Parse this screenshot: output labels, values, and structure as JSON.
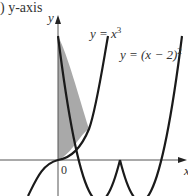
{
  "caption": "y-axis",
  "caption_prefix": ")",
  "axes": {
    "y_label": "y",
    "x_label": "x",
    "origin_label": "0"
  },
  "curves": [
    {
      "name": "cubic",
      "label_lhs": "y = x",
      "label_exp": "3",
      "equation": "y = x^3"
    },
    {
      "name": "parabola",
      "label_lhs": "y = (x − 2)",
      "label_exp": "2",
      "equation": "y = (x - 2)^2"
    }
  ],
  "shaded_region": {
    "description": "Region bounded by y-axis, y = x^3 and y = (x - 2)^2",
    "x_range": [
      0,
      1
    ],
    "fill_color": "#a9a9a9"
  },
  "colors": {
    "curve": "#1a1a1a",
    "axis": "#555555",
    "shade": "#a9a9a9"
  }
}
